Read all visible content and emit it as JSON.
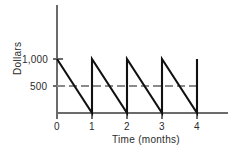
{
  "chart_data": {
    "type": "line",
    "title": "",
    "xlabel": "Time (months)",
    "ylabel": "Dollars",
    "xlim": [
      0,
      4
    ],
    "ylim": [
      0,
      1000
    ],
    "grid": false,
    "legend": null,
    "x_ticks": [
      "0",
      "1",
      "2",
      "3",
      "4"
    ],
    "x_tick_values": [
      0,
      1,
      2,
      3,
      4
    ],
    "y_ticks": [
      "500",
      "1,000"
    ],
    "y_tick_values": [
      500,
      1000
    ],
    "series": [
      {
        "name": "Account balance",
        "style": "solid",
        "color": "#111111",
        "description": "Sawtooth: balance starts at 1,000 and falls linearly to 0 over each month, then is instantly replenished to 1,000.",
        "points": [
          {
            "x": 0,
            "y": 1000
          },
          {
            "x": 1,
            "y": 0
          },
          {
            "x": 1,
            "y": 1000
          },
          {
            "x": 2,
            "y": 0
          },
          {
            "x": 2,
            "y": 1000
          },
          {
            "x": 3,
            "y": 0
          },
          {
            "x": 3,
            "y": 1000
          },
          {
            "x": 4,
            "y": 0
          },
          {
            "x": 4,
            "y": 1000
          }
        ]
      }
    ],
    "reference_lines": [
      {
        "name": "average-balance",
        "orientation": "horizontal",
        "value": 500,
        "style": "dashed",
        "color": "#8a8a8a",
        "x_start": 0,
        "x_end": 4
      }
    ]
  }
}
